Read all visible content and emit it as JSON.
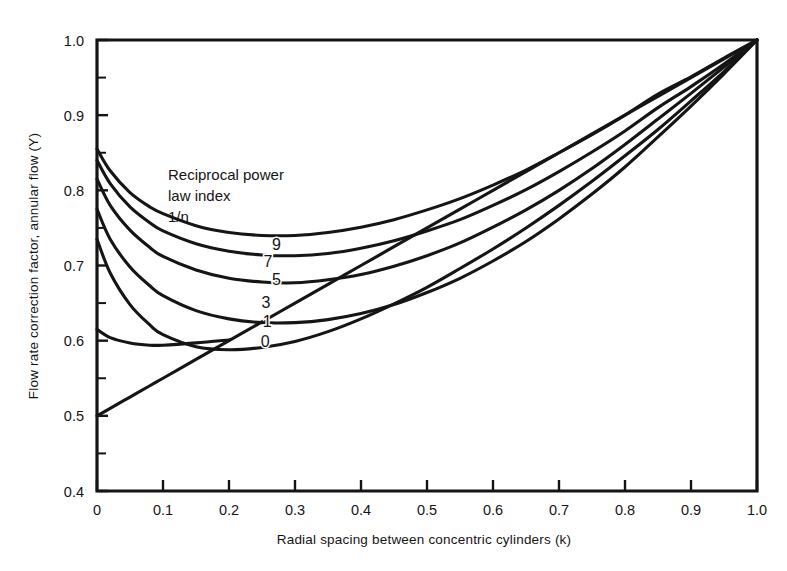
{
  "chart_data": {
    "type": "line",
    "title": "",
    "xlabel": "Radial spacing between concentric cylinders (k)",
    "ylabel": "Flow rate correction factor, annular flow (Y)",
    "xlim": [
      0.0,
      1.0
    ],
    "ylim": [
      0.4,
      1.0
    ],
    "grid": false,
    "legend_position": "inline-curve-labels",
    "annotation": {
      "line1": "Reciprocal power",
      "line2": "law index",
      "line3": "1/n"
    },
    "xticks": [
      "0",
      "0.1",
      "0.2",
      "0.3",
      "0.4",
      "0.5",
      "0.6",
      "0.7",
      "0.8",
      "0.9",
      "1.0"
    ],
    "xtick_values": [
      0.0,
      0.1,
      0.2,
      0.3,
      0.4,
      0.5,
      0.6,
      0.7,
      0.8,
      0.9,
      1.0
    ],
    "yticks": [
      "0.4",
      "0.5",
      "0.6",
      "0.7",
      "0.8",
      "0.9",
      "1.0"
    ],
    "ytick_values": [
      0.4,
      0.5,
      0.6,
      0.7,
      0.8,
      0.9,
      1.0
    ],
    "yminor_values": [
      0.45,
      0.55,
      0.65,
      0.75,
      0.85,
      0.95
    ],
    "x": [
      0.0,
      0.02,
      0.05,
      0.08,
      0.1,
      0.15,
      0.2,
      0.25,
      0.3,
      0.35,
      0.4,
      0.45,
      0.5,
      0.55,
      0.6,
      0.65,
      0.7,
      0.75,
      0.8,
      0.85,
      0.9,
      0.95,
      1.0
    ],
    "series": [
      {
        "name": "9",
        "label": "9",
        "label_x": 0.272,
        "label_y": 0.729,
        "values": [
          0.855,
          0.826,
          0.797,
          0.778,
          0.769,
          0.753,
          0.744,
          0.74,
          0.74,
          0.744,
          0.751,
          0.761,
          0.774,
          0.789,
          0.807,
          0.827,
          0.85,
          0.874,
          0.9,
          0.928,
          0.951,
          0.976,
          1.0
        ]
      },
      {
        "name": "7",
        "label": "7",
        "label_x": 0.259,
        "label_y": 0.706,
        "values": [
          0.84,
          0.809,
          0.778,
          0.757,
          0.746,
          0.729,
          0.719,
          0.714,
          0.713,
          0.716,
          0.723,
          0.733,
          0.746,
          0.761,
          0.78,
          0.801,
          0.825,
          0.851,
          0.879,
          0.91,
          0.938,
          0.968,
          1.0
        ]
      },
      {
        "name": "5",
        "label": "5",
        "label_x": 0.272,
        "label_y": 0.682,
        "values": [
          0.815,
          0.78,
          0.747,
          0.724,
          0.712,
          0.694,
          0.683,
          0.678,
          0.677,
          0.681,
          0.688,
          0.699,
          0.713,
          0.73,
          0.751,
          0.774,
          0.8,
          0.829,
          0.861,
          0.895,
          0.929,
          0.964,
          1.0
        ]
      },
      {
        "name": "3",
        "label": "3",
        "label_x": 0.256,
        "label_y": 0.652,
        "values": [
          0.775,
          0.735,
          0.698,
          0.673,
          0.66,
          0.64,
          0.629,
          0.624,
          0.624,
          0.628,
          0.636,
          0.648,
          0.664,
          0.683,
          0.706,
          0.732,
          0.762,
          0.795,
          0.831,
          0.871,
          0.912,
          0.955,
          1.0
        ]
      },
      {
        "name": "1",
        "label": "1",
        "label_x": 0.258,
        "label_y": 0.626,
        "values": [
          0.735,
          0.69,
          0.648,
          0.621,
          0.608,
          0.592,
          0.588,
          0.591,
          0.599,
          0.612,
          0.629,
          0.649,
          0.671,
          0.696,
          0.722,
          0.75,
          0.78,
          0.812,
          0.846,
          0.881,
          0.919,
          0.958,
          1.0
        ]
      },
      {
        "name": "0",
        "label": "0",
        "label_x": 0.255,
        "label_y": 0.6,
        "values": [
          0.5,
          0.51,
          0.525,
          0.54,
          0.55,
          0.575,
          0.6,
          0.625,
          0.65,
          0.675,
          0.7,
          0.725,
          0.75,
          0.775,
          0.8,
          0.825,
          0.85,
          0.875,
          0.9,
          0.925,
          0.95,
          0.975,
          1.0
        ]
      },
      {
        "name": "0-min-branch",
        "label": "",
        "label_x": null,
        "label_y": null,
        "values": [
          0.615,
          0.604,
          0.597,
          0.594,
          0.594,
          0.597,
          0.601,
          null,
          null,
          null,
          null,
          null,
          null,
          null,
          null,
          null,
          null,
          null,
          null,
          null,
          null,
          null,
          null
        ]
      }
    ]
  }
}
